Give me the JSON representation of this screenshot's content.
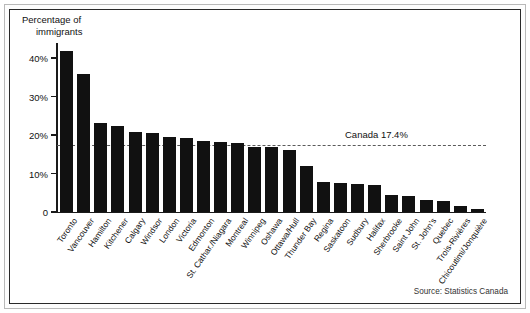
{
  "figure": {
    "axis_title_line1": "Percentage of",
    "axis_title_line2": "immigrants",
    "source": "Source: Statistics Canada"
  },
  "chart_data": {
    "type": "bar",
    "title": "Percentage of immigrants",
    "xlabel": "",
    "ylabel": "Percentage of immigrants",
    "ylim": [
      0,
      45
    ],
    "grid": false,
    "legend_position": "none",
    "ytick_labels": [
      "0",
      "10%",
      "20%",
      "30%",
      "40%"
    ],
    "ytick_values": [
      0,
      10,
      20,
      30,
      40
    ],
    "annotation": {
      "label": "Canada 17.4%",
      "value": 17.4,
      "style": "dashed-horizontal-reference-line"
    },
    "categories": [
      "Toronto",
      "Vancouver",
      "Hamilton",
      "Kitchener",
      "Calgary",
      "Windsor",
      "London",
      "Victoria",
      "Edmonton",
      "St. Cathar./Niagara",
      "Montreal",
      "Winnipeg",
      "Oshawa",
      "Ottawa/Hull",
      "Thunder Bay",
      "Regina",
      "Saskatoon",
      "Sudbury",
      "Halifax",
      "Sherbrooke",
      "Saint John",
      "St. John's",
      "Quebec",
      "Trois-Rivières",
      "Chicoutimi/Jonquière"
    ],
    "values": [
      41.9,
      35.8,
      23.2,
      22.4,
      20.9,
      20.4,
      19.5,
      19.3,
      18.4,
      18.1,
      17.8,
      17.0,
      17.0,
      16.0,
      11.9,
      7.7,
      7.5,
      7.3,
      6.9,
      4.4,
      4.2,
      3.2,
      2.9,
      1.5,
      0.9
    ]
  }
}
